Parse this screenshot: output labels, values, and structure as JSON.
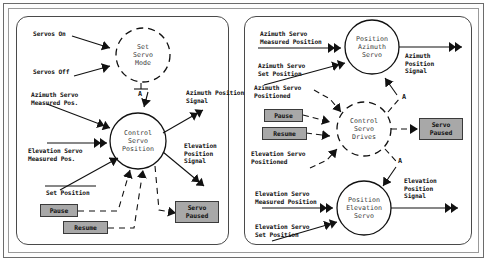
{
  "diagram": {
    "panels": [
      {
        "id": "left",
        "bubbles": [
          {
            "id": "set-servo-mode",
            "text": "Set\nServo\nMode",
            "style": "dashed"
          },
          {
            "id": "control-servo-position",
            "text": "Control\nServo\nPosition",
            "style": "solid"
          }
        ],
        "inputs": [
          {
            "id": "servos-on",
            "text": "Servos On"
          },
          {
            "id": "servos-off",
            "text": "Servos Off"
          },
          {
            "id": "azimuth-servo-measured-pos",
            "text": "Azimuth Servo\nMeasured Pos."
          },
          {
            "id": "elevation-servo-measured-pos",
            "text": "Elevation Servo\nMeasured Pos."
          },
          {
            "id": "set-position",
            "text": "Set Position"
          }
        ],
        "outputs": [
          {
            "id": "azimuth-position-signal",
            "text": "Azimuth Position\nSignal"
          },
          {
            "id": "elevation-position-signal",
            "text": "Elevation\nPosition\nSignal"
          }
        ],
        "control_boxes": [
          {
            "id": "pause",
            "text": "Pause"
          },
          {
            "id": "resume",
            "text": "Resume"
          },
          {
            "id": "servo-paused",
            "text": "Servo\nPaused"
          }
        ],
        "junctions": [
          {
            "id": "junction-a",
            "text": "A"
          }
        ]
      },
      {
        "id": "right",
        "bubbles": [
          {
            "id": "position-azimuth-servo",
            "text": "Position\nAzimuth\nServo",
            "style": "solid"
          },
          {
            "id": "control-servo-drives",
            "text": "Control\nServo\nDrives",
            "style": "dashed"
          },
          {
            "id": "position-elevation-servo",
            "text": "Position\nElevation\nServo",
            "style": "solid"
          }
        ],
        "inputs": [
          {
            "id": "azimuth-servo-measured-position",
            "text": "Azimuth Servo\nMeasured Position"
          },
          {
            "id": "azimuth-servo-set-position",
            "text": "Azimuth Servo\nSet Position"
          },
          {
            "id": "azimuth-servo-positioned",
            "text": "Azimuth Servo\nPositioned"
          },
          {
            "id": "elevation-servo-positioned",
            "text": "Elevation Servo\nPositioned"
          },
          {
            "id": "elevation-servo-measured-position",
            "text": "Elevation Servo\nMeasured Position"
          },
          {
            "id": "elevation-servo-set-position",
            "text": "Elevation Servo\nSet Position"
          }
        ],
        "outputs": [
          {
            "id": "azimuth-position-signal",
            "text": "Azimuth\nPosition\nSignal"
          },
          {
            "id": "elevation-position-signal",
            "text": "Elevation\nPosition\nSignal"
          }
        ],
        "control_boxes": [
          {
            "id": "pause",
            "text": "Pause"
          },
          {
            "id": "resume",
            "text": "Resume"
          },
          {
            "id": "servo-paused",
            "text": "Servo\nPaused"
          }
        ],
        "junctions": [
          {
            "id": "junction-a-upper",
            "text": "A"
          },
          {
            "id": "junction-a-lower",
            "text": "A"
          }
        ]
      }
    ],
    "colors": {
      "control_box_fill": "#a8a8a8",
      "stroke": "#111111",
      "frame": "#6b6b6b",
      "bubble_text": "#3b3b3b"
    }
  }
}
